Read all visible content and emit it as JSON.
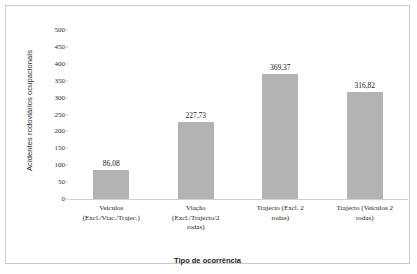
{
  "chart_data": {
    "type": "bar",
    "title": "",
    "xlabel": "Tipo de ocorrência",
    "ylabel": "Acidentes rodoviários ocupacionais",
    "categories": [
      "Veículos (Excl./Viac./Trajec.)",
      "Viação (Excl./Trajecto/2 rodas)",
      "Trajecto (Excl. 2 rodas)",
      "Trajecto (Veículos 2 rodas)"
    ],
    "category_lines": [
      [
        "Veículos",
        "(Excl./Viac./Trajec.)"
      ],
      [
        "Viação",
        "(Excl./Trajecto/2",
        "rodas)"
      ],
      [
        "Trajecto (Excl. 2",
        "rodas)"
      ],
      [
        "Trajecto (Veículos 2",
        "rodas)"
      ]
    ],
    "values": [
      86.08,
      227.73,
      369.37,
      316.82
    ],
    "value_labels": [
      "86,08",
      "227,73",
      "369,37",
      "316,82"
    ],
    "ylim": [
      0,
      500
    ],
    "yticks": [
      0,
      50,
      100,
      150,
      200,
      250,
      300,
      350,
      400,
      450,
      500
    ],
    "ytick_labels": [
      "0",
      "50",
      "100",
      "150",
      "200",
      "250",
      "300",
      "350",
      "400",
      "450",
      "500"
    ],
    "grid": false,
    "legend": null,
    "bar_color": "#b3b3b3",
    "frame_color": "#c9c9c9",
    "text_color": "#1a1a1a"
  }
}
